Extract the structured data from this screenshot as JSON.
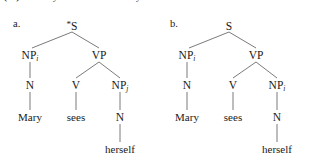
{
  "caption": {
    "text": "(27) a. *Mary sees herself. b. Mary sees herself."
  },
  "trees": [
    {
      "id": "a",
      "item_label": "a.",
      "grammatical": false,
      "ungrammatical_marker": "*",
      "root": "S",
      "nodes": {
        "root": "S",
        "subject_np": "NP",
        "subject_np_subscript": "i",
        "vp": "VP",
        "subject_n": "N",
        "verb_v": "V",
        "object_np": "NP",
        "object_np_subscript": "j",
        "object_n": "N"
      },
      "leaves": {
        "subject_word": "Mary",
        "verb_word": "sees",
        "object_word": "herself"
      }
    },
    {
      "id": "b",
      "item_label": "b.",
      "grammatical": true,
      "ungrammatical_marker": "",
      "root": "S",
      "nodes": {
        "root": "S",
        "subject_np": "NP",
        "subject_np_subscript": "i",
        "vp": "VP",
        "subject_n": "N",
        "verb_v": "V",
        "object_np": "NP",
        "object_np_subscript": "i",
        "object_n": "N"
      },
      "leaves": {
        "subject_word": "Mary",
        "verb_word": "sees",
        "object_word": "herself"
      }
    }
  ],
  "style": {
    "line_color": "#6b6b6b",
    "text_color": "#1a1a1a",
    "background": "#ffffff"
  }
}
